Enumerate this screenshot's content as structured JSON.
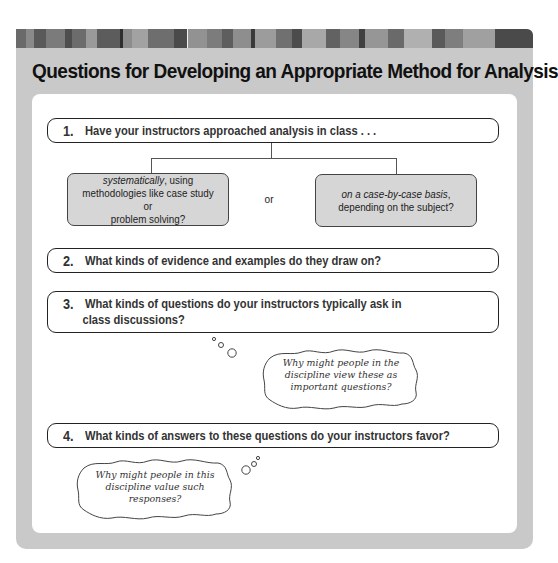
{
  "header": {
    "title": "Questions for Developing an Appropriate Method for Analysis",
    "stripe_colors": [
      "#6a6a6a",
      "#8a8a8a",
      "#5a5a5a",
      "#7b7b7b",
      "#4e4e4e",
      "#6c6c6c",
      "#9a9a9a",
      "#5c5c5c",
      "#2e2e2e",
      "#8c8c8c",
      "#a2a2a2",
      "#6e6e6e",
      "#4a4a4a",
      "#f0f0f0",
      "#929292",
      "#7c7c7c",
      "#5e5e5e",
      "#8e8e8e",
      "#3a3a3a",
      "#9c9c9c",
      "#707070",
      "#4c4c4c",
      "#a8a8a8",
      "#626262",
      "#868686",
      "#404040",
      "#969696",
      "#6a6a6a",
      "#b0b0b0",
      "#5a5a5a",
      "#7e7e7e",
      "#a0a0a0",
      "#4a4a4a"
    ]
  },
  "questions": [
    {
      "number": "1.",
      "text": "Have your instructors approached analysis in class . . ."
    },
    {
      "number": "2.",
      "text": "What kinds of evidence and examples do they draw on?"
    },
    {
      "number": "3.",
      "text_line1": "What kinds of questions do your instructors typically ask in",
      "text_line2": "class discussions?"
    },
    {
      "number": "4.",
      "text": "What kinds of answers to these questions do your instructors favor?"
    }
  ],
  "options": {
    "left": {
      "italic": "systematically",
      "rest_line1": ", using",
      "line2": "methodologies like case study or",
      "line3": "problem solving?"
    },
    "connector": "or",
    "right": {
      "italic": "on a case-by-case basis",
      "rest_line1": ",",
      "line2": "depending on the subject?"
    }
  },
  "thoughts": [
    {
      "line1": "Why might people in the",
      "line2": "discipline view these as",
      "line3": "important questions?"
    },
    {
      "line1": "Why might people in this",
      "line2": "discipline value such",
      "line3": "responses?"
    }
  ],
  "colors": {
    "panel": "#c9c9c9",
    "option_fill": "#d6d6d6",
    "border": "#222222"
  }
}
